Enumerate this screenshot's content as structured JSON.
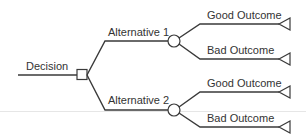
{
  "diagram": {
    "type": "decision-tree",
    "colors": {
      "line": "#3a3a3a",
      "text": "#333333",
      "background": "#ffffff",
      "rule": "#e6e6e6"
    },
    "root": {
      "label": "Decision",
      "node": "decision-square"
    },
    "alternatives": [
      {
        "label": "Alternative 1",
        "node": "chance-circle",
        "outcomes": [
          {
            "label": "Good Outcome",
            "node": "end-triangle"
          },
          {
            "label": "Bad Outcome",
            "node": "end-triangle"
          }
        ]
      },
      {
        "label": "Alternative 2",
        "node": "chance-circle",
        "outcomes": [
          {
            "label": "Good Outcome",
            "node": "end-triangle"
          },
          {
            "label": "Bad Outcome",
            "node": "end-triangle"
          }
        ]
      }
    ]
  }
}
